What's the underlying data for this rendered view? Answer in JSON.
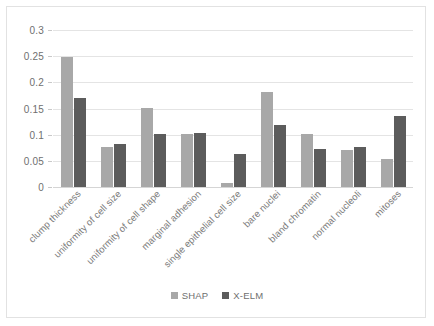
{
  "colors": {
    "shap": "#a8a8a8",
    "xelm": "#5c5c5c",
    "gridline": "#e4e4e4",
    "axis_text": "#6f6f6f",
    "frame": "#e2e2e2"
  },
  "legend": {
    "position": "bottom-center",
    "entries": [
      {
        "label": "SHAP",
        "color": "#a8a8a8"
      },
      {
        "label": "X-ELM",
        "color": "#5c5c5c"
      }
    ]
  },
  "axis": {
    "y_ticks": [
      "0",
      "0.05",
      "0.1",
      "0.15",
      "0.2",
      "0.25",
      "0.3"
    ],
    "y_tick_values": [
      0,
      0.05,
      0.1,
      0.15,
      0.2,
      0.25,
      0.3
    ]
  },
  "chart_data": {
    "type": "bar",
    "title": "",
    "subtitle": "",
    "xlabel": "",
    "ylabel": "",
    "ylim": [
      0,
      0.3
    ],
    "grid": true,
    "legend_position": "bottom-center",
    "categories": [
      "clump thickness",
      "uniformity of cell size",
      "uniformity of cell shape",
      "marginal adhesion",
      "single epithelial cell size",
      "bare nuclei",
      "bland chromatin",
      "normal nucleoli",
      "mitoses"
    ],
    "series": [
      {
        "name": "SHAP",
        "color": "#a8a8a8",
        "values": [
          0.249,
          0.076,
          0.151,
          0.101,
          0.008,
          0.181,
          0.101,
          0.071,
          0.054
        ]
      },
      {
        "name": "X-ELM",
        "color": "#5c5c5c",
        "values": [
          0.17,
          0.083,
          0.102,
          0.103,
          0.063,
          0.119,
          0.073,
          0.077,
          0.136
        ]
      }
    ],
    "y_ticks": [
      0,
      0.05,
      0.1,
      0.15,
      0.2,
      0.25,
      0.3
    ],
    "y_tick_labels": [
      "0",
      "0.05",
      "0.1",
      "0.15",
      "0.2",
      "0.25",
      "0.3"
    ]
  }
}
